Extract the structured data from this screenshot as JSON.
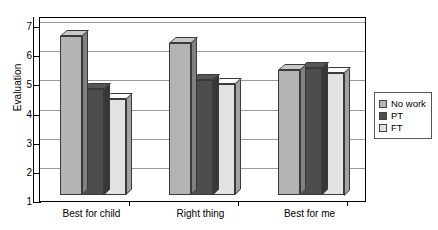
{
  "chart_data": {
    "type": "bar",
    "title": "",
    "xlabel": "",
    "ylabel": "Evaluation",
    "categories": [
      "Best for child",
      "Right thing",
      "Best for me"
    ],
    "series": [
      {
        "name": "No work",
        "color": "#b3b3b3",
        "values": [
          6.45,
          6.2,
          5.3
        ]
      },
      {
        "name": "PT",
        "color": "#4d4d4d",
        "values": [
          4.65,
          4.95,
          5.35
        ]
      },
      {
        "name": "FT",
        "color": "#e2e2e2",
        "values": [
          4.3,
          4.8,
          5.2
        ]
      }
    ],
    "ylim": [
      1,
      7
    ],
    "yticks": [
      1,
      2,
      3,
      4,
      5,
      6,
      7
    ],
    "ytick_labels": [
      "1",
      "2",
      "3",
      "4",
      "5",
      "6",
      "7"
    ],
    "grid": true,
    "legend_position": "right",
    "style": "3d-column"
  },
  "legend": {
    "entries": [
      {
        "label": "No work"
      },
      {
        "label": "PT"
      },
      {
        "label": "FT"
      }
    ]
  }
}
